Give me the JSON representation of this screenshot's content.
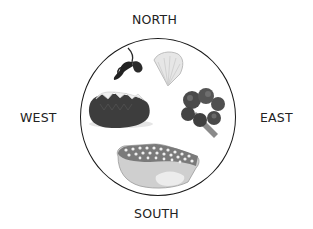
{
  "directions": {
    "north": "NORTH",
    "south": "SOUTH",
    "east": "EAST",
    "west": "WEST"
  },
  "plate": {
    "items": [
      {
        "name": "parsley",
        "position": "north-west"
      },
      {
        "name": "lemon-wedge",
        "position": "north-east"
      },
      {
        "name": "baked-potato",
        "position": "west"
      },
      {
        "name": "broccoli",
        "position": "east"
      },
      {
        "name": "salmon-steak",
        "position": "south"
      }
    ]
  }
}
